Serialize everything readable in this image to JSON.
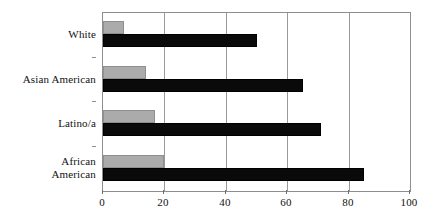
{
  "chart_data": {
    "type": "bar",
    "orientation": "horizontal",
    "title": "",
    "subtitle": "",
    "xlabel": "",
    "ylabel": "",
    "categories": [
      "White",
      "Asian American",
      "Latino/a",
      "African\nAmerican"
    ],
    "series": [
      {
        "name": "gray-series",
        "color": "#ababab",
        "values": [
          7,
          14,
          17,
          20
        ]
      },
      {
        "name": "black-series",
        "color": "#0a0a0a",
        "values": [
          50,
          65,
          71,
          85
        ]
      }
    ],
    "xlim": [
      0,
      100
    ],
    "xticks": [
      0,
      20,
      40,
      60,
      80,
      100
    ],
    "xtick_labels": [
      "0",
      "20",
      "40",
      "60",
      "80",
      "100"
    ],
    "grid": true,
    "grid_axis": "x",
    "legend": false,
    "legend_position": "none"
  },
  "style": {
    "plot_border_color": "#8e8e8e",
    "gridline_color": "#9a9a9a",
    "background": "#ffffff",
    "text_color": "#111111"
  }
}
